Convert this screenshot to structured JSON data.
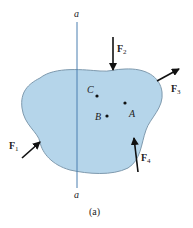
{
  "figure": {
    "caption": "(a)",
    "axis": {
      "top_label": "a",
      "bottom_label": "a",
      "color": "#4a7fb0"
    },
    "body": {
      "fill": "#b5d5ea",
      "stroke": "#7f9aae"
    },
    "points": [
      {
        "id": "C",
        "label": "C"
      },
      {
        "id": "A",
        "label": "A"
      },
      {
        "id": "B",
        "label": "B"
      }
    ],
    "forces": [
      {
        "id": "F1",
        "name": "F",
        "sub": "1"
      },
      {
        "id": "F2",
        "name": "F",
        "sub": "2"
      },
      {
        "id": "F3",
        "name": "F",
        "sub": "3"
      },
      {
        "id": "F4",
        "name": "F",
        "sub": "4"
      }
    ]
  }
}
